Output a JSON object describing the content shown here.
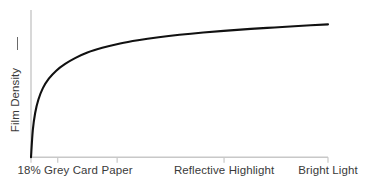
{
  "chart_data": {
    "type": "line",
    "title": "",
    "subtitle": "",
    "xlabel": "",
    "ylabel": "Film Density",
    "ylabel_arrow": "increasing-arrow",
    "grid": false,
    "legend": null,
    "legend_position": "none",
    "xlim": [
      0,
      100
    ],
    "ylim": [
      0,
      100
    ],
    "axis_color": "#c8c8c8",
    "curve_color": "#111111",
    "text_color": "#3a3a3a",
    "background_color": "#ffffff",
    "x_tick_labels": [
      "18% Grey Card",
      "Paper",
      "Reflective Highlight",
      "Bright Light"
    ],
    "x_tick_positions": [
      9.0,
      29.0,
      65.0,
      100.0
    ],
    "y_tick_labels": [],
    "series": [
      {
        "name": "Film characteristic curve",
        "x": [
          0.0,
          0.6,
          1.4,
          2.5,
          4.0,
          6.0,
          8.5,
          11.5,
          15.0,
          19.0,
          24.0,
          30.0,
          36.0,
          43.0,
          50.0,
          58.0,
          66.0,
          74.0,
          82.0,
          90.0,
          100.0
        ],
        "y": [
          0.0,
          20.0,
          33.0,
          43.0,
          51.5,
          58.5,
          64.5,
          69.5,
          74.0,
          78.0,
          81.5,
          84.8,
          87.2,
          89.4,
          91.2,
          92.9,
          94.3,
          95.6,
          96.7,
          97.8,
          99.0
        ]
      }
    ]
  },
  "axis": {
    "y_title": "Film Density"
  }
}
